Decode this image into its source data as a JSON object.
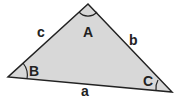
{
  "diagram": {
    "type": "triangle",
    "fill": "#d8d8d8",
    "stroke": "#222222",
    "vertices": {
      "A": [
        88,
        4
      ],
      "B": [
        8,
        77
      ],
      "C": [
        172,
        92
      ]
    },
    "angle_labels": {
      "A": "A",
      "B": "B",
      "C": "C"
    },
    "side_labels": {
      "a": "a",
      "b": "b",
      "c": "c"
    }
  }
}
